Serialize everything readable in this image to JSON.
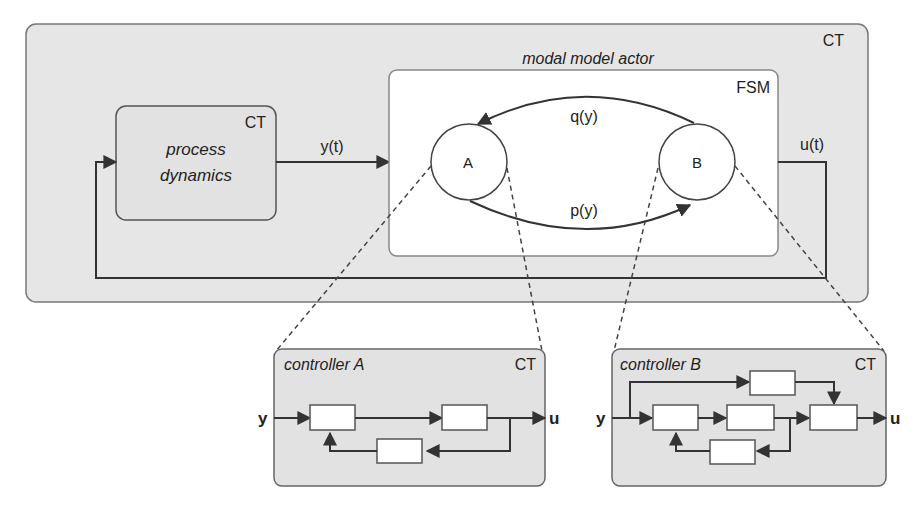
{
  "outer": {
    "domain_label": "CT"
  },
  "process": {
    "line1": "process",
    "line2": "dynamics",
    "domain_label": "CT"
  },
  "signals": {
    "y_t": "y(t)",
    "u_t": "u(t)"
  },
  "modal": {
    "title": "modal model actor",
    "fsm_label": "FSM"
  },
  "states": {
    "a": "A",
    "b": "B"
  },
  "transitions": {
    "b_to_a": "q(y)",
    "a_to_b": "p(y)"
  },
  "controller_a": {
    "title": "controller A",
    "domain_label": "CT",
    "input": "y",
    "output": "u"
  },
  "controller_b": {
    "title": "controller B",
    "domain_label": "CT",
    "input": "y",
    "output": "u"
  },
  "colors": {
    "panel_fill": "#e6e6e6",
    "stroke": "#444444",
    "white": "#ffffff",
    "text": "#222222"
  }
}
